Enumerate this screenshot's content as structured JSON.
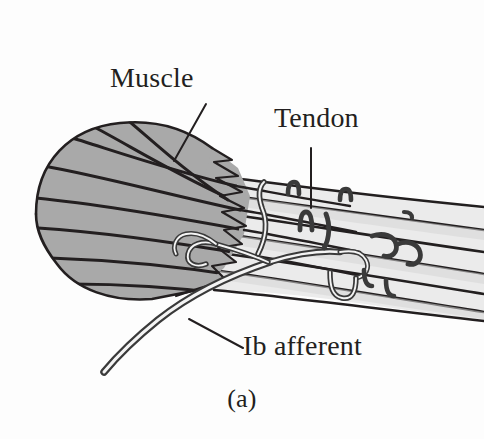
{
  "figure": {
    "caption": "(a)",
    "labels": {
      "muscle": "Muscle",
      "tendon": "Tendon",
      "ib_afferent": "Ib afferent"
    },
    "colors": {
      "background": "#fdfdfd",
      "muscle_fill": "#a9a9a9",
      "tendon_fill": "#ebebeb",
      "tendon_fill_shaded": "#dcdcdc",
      "ink": "#231f20",
      "nerve": "#3a3a3a",
      "text": "#231f20"
    },
    "icon_names": {
      "muscle_leader": "leader-line-icon",
      "tendon_leader": "leader-line-icon",
      "ib_leader": "leader-line-icon"
    },
    "parts": [
      {
        "name": "muscle-belly",
        "label": "Muscle",
        "fill": "#a9a9a9",
        "description": "shaded rounded muscle mass at left with converging fiber lines"
      },
      {
        "name": "tendon-bundle",
        "label": "Tendon",
        "fill": "#ebebeb",
        "description": "light collagen fascicles running to lower right"
      },
      {
        "name": "ib-afferent-nerve",
        "label": "Ib afferent",
        "fill": "#3a3a3a",
        "description": "sensory axon branching among tendon fascicles, trunk exiting lower left"
      },
      {
        "name": "musculotendinous-junction",
        "label": "",
        "fill": "",
        "description": "interdigitating zigzag boundary between muscle fibers and tendon"
      }
    ],
    "leaders": [
      {
        "name": "muscle-leader",
        "from": [
          206,
          104
        ],
        "to": [
          174,
          160
        ]
      },
      {
        "name": "tendon-leader",
        "from": [
          311,
          148
        ],
        "to": [
          311,
          208
        ]
      },
      {
        "name": "ib-leader",
        "from": [
          189,
          319
        ],
        "to": [
          243,
          348
        ]
      }
    ]
  }
}
